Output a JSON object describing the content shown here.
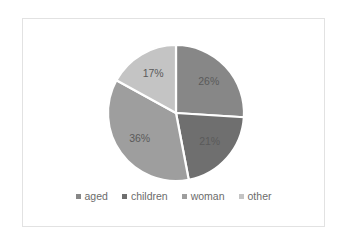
{
  "chart_data": {
    "type": "pie",
    "title": "",
    "categories": [
      "aged",
      "children",
      "woman",
      "other"
    ],
    "values": [
      26,
      21,
      36,
      17
    ],
    "unit": "%",
    "data_labels": [
      "26%",
      "21%",
      "36%",
      "17%"
    ],
    "colors": [
      "#878787",
      "#6f6f6f",
      "#9e9e9e",
      "#c4c4c4"
    ],
    "start_angle_deg": 0,
    "direction": "clockwise",
    "legend_position": "bottom",
    "grid": false,
    "label_color": "#5a5a5a",
    "separator_color": "#ffffff",
    "background": "#ffffff",
    "border_color": "#e2e2e2"
  },
  "legend": {
    "items": [
      {
        "label": "aged",
        "color": "#878787"
      },
      {
        "label": "children",
        "color": "#6f6f6f"
      },
      {
        "label": "woman",
        "color": "#9e9e9e"
      },
      {
        "label": "other",
        "color": "#c4c4c4"
      }
    ]
  },
  "slices": [
    {
      "label": "aged",
      "percent_text": "26%"
    },
    {
      "label": "children",
      "percent_text": "21%"
    },
    {
      "label": "woman",
      "percent_text": "36%"
    },
    {
      "label": "other",
      "percent_text": "17%"
    }
  ]
}
